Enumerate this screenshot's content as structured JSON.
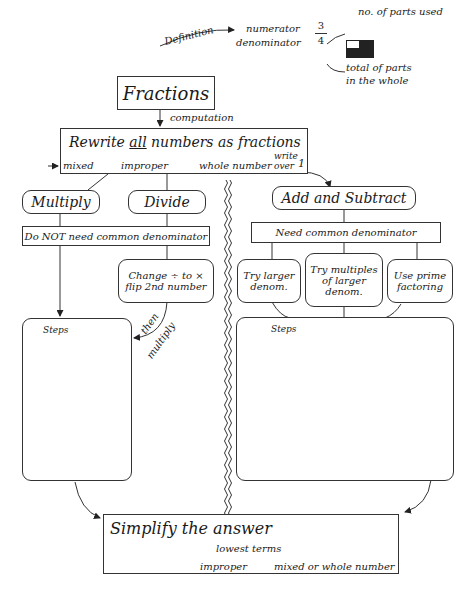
{
  "definition": {
    "label": "Definition",
    "numerator_label": "numerator",
    "denominator_label": "denominator",
    "numerator": "3",
    "denominator": "4",
    "parts_used": "no. of parts used",
    "total_parts_line1": "total of parts",
    "total_parts_line2": "in the whole",
    "icon": "fraction-grid-icon"
  },
  "root": {
    "title": "Fractions",
    "edge_label": "computation"
  },
  "rewrite": {
    "title_pre": "Rewrite ",
    "title_underlined": "all",
    "title_post": " numbers as fractions",
    "mixed": "mixed",
    "improper": "improper",
    "whole": "whole number",
    "write": "write",
    "over": "over",
    "one": "1"
  },
  "left": {
    "multiply": "Multiply",
    "divide": "Divide",
    "no_common": "Do NOT need common denominator",
    "change_line1": "Change ÷ to ×",
    "change_line2": "flip 2nd number",
    "then": "then",
    "multiply_edge": "multiply",
    "steps": "Steps"
  },
  "right": {
    "add_subtract": "Add and Subtract",
    "need_common": "Need common denominator",
    "opt1_line1": "Try larger",
    "opt1_line2": "denom.",
    "opt2_line1": "Try multiples",
    "opt2_line2": "of larger",
    "opt2_line3": "denom.",
    "opt3_line1": "Use prime",
    "opt3_line2": "factoring",
    "steps": "Steps"
  },
  "simplify": {
    "title": "Simplify the answer",
    "lowest": "lowest terms",
    "improper": "improper",
    "result": "mixed or whole number"
  }
}
